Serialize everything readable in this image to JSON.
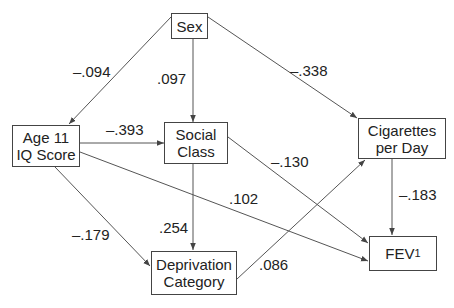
{
  "diagram": {
    "type": "path-diagram",
    "nodes": {
      "sex": {
        "line1": "Sex",
        "line2": ""
      },
      "iq": {
        "line1": "Age 11",
        "line2": "IQ Score"
      },
      "social": {
        "line1": "Social",
        "line2": "Class"
      },
      "cigs": {
        "line1": "Cigarettes",
        "line2": "per Day"
      },
      "fev": {
        "main": "FEV",
        "sub": "1"
      },
      "depriv": {
        "line1": "Deprivation",
        "line2": "Category"
      }
    },
    "edges": [
      {
        "from": "Sex",
        "to": "Age 11 IQ Score",
        "coef": "–.094"
      },
      {
        "from": "Sex",
        "to": "Social Class",
        "coef": ".097"
      },
      {
        "from": "Sex",
        "to": "Cigarettes per Day",
        "coef": "–.338"
      },
      {
        "from": "Age 11 IQ Score",
        "to": "Social Class",
        "coef": "–.393"
      },
      {
        "from": "Age 11 IQ Score",
        "to": "FEV1",
        "coef": ".102"
      },
      {
        "from": "Age 11 IQ Score",
        "to": "Deprivation Category",
        "coef": "–.179"
      },
      {
        "from": "Social Class",
        "to": "FEV1",
        "coef": "–.130"
      },
      {
        "from": "Social Class",
        "to": "Deprivation Category",
        "coef": ".254"
      },
      {
        "from": "Deprivation Category",
        "to": "Cigarettes per Day",
        "coef": ".086"
      },
      {
        "from": "Cigarettes per Day",
        "to": "FEV1",
        "coef": "–.183"
      }
    ]
  },
  "labels": {
    "sex_iq": "–.094",
    "sex_social": ".097",
    "sex_cigs": "–.338",
    "iq_social": "–.393",
    "iq_fev": ".102",
    "iq_depriv": "–.179",
    "social_fev": "–.130",
    "social_depriv": ".254",
    "depriv_cigs": ".086",
    "cigs_fev": "–.183"
  },
  "colors": {
    "line": "#444444",
    "text": "#222222",
    "background": "#ffffff"
  }
}
